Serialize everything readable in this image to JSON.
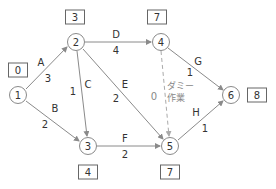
{
  "diagram": {
    "type": "arrow-diagram-pert",
    "colors": {
      "line": "#8a8a8a",
      "dummy_line": "#aaaaaa",
      "text": "#333333",
      "dummy_text": "#888888"
    },
    "nodes": [
      {
        "id": "1",
        "label": "1",
        "earliest": "0",
        "x": 18,
        "y": 95,
        "box_x": 18,
        "box_y": 70
      },
      {
        "id": "2",
        "label": "2",
        "earliest": "3",
        "x": 76,
        "y": 42,
        "box_x": 75,
        "box_y": 17
      },
      {
        "id": "3",
        "label": "3",
        "earliest": "4",
        "x": 88,
        "y": 146,
        "box_x": 88,
        "box_y": 172
      },
      {
        "id": "4",
        "label": "4",
        "earliest": "7",
        "x": 161,
        "y": 42,
        "box_x": 157,
        "box_y": 17
      },
      {
        "id": "5",
        "label": "5",
        "earliest": "7",
        "x": 170,
        "y": 146,
        "box_x": 170,
        "box_y": 172
      },
      {
        "id": "6",
        "label": "6",
        "earliest": "8",
        "x": 231,
        "y": 95,
        "box_x": 257,
        "box_y": 95
      }
    ],
    "activities": [
      {
        "name": "A",
        "from": "1",
        "to": "2",
        "duration": "3"
      },
      {
        "name": "B",
        "from": "1",
        "to": "3",
        "duration": "2"
      },
      {
        "name": "C",
        "from": "2",
        "to": "3",
        "duration": "1"
      },
      {
        "name": "D",
        "from": "2",
        "to": "4",
        "duration": "4"
      },
      {
        "name": "E",
        "from": "2",
        "to": "5",
        "duration": "2"
      },
      {
        "name": "F",
        "from": "3",
        "to": "5",
        "duration": "2"
      },
      {
        "name": "G",
        "from": "4",
        "to": "6",
        "duration": "1"
      },
      {
        "name": "H",
        "from": "5",
        "to": "6",
        "duration": "1"
      }
    ],
    "dummy": {
      "from": "4",
      "to": "5",
      "duration": "0",
      "label_line1": "ダミー",
      "label_line2": "作業"
    }
  }
}
